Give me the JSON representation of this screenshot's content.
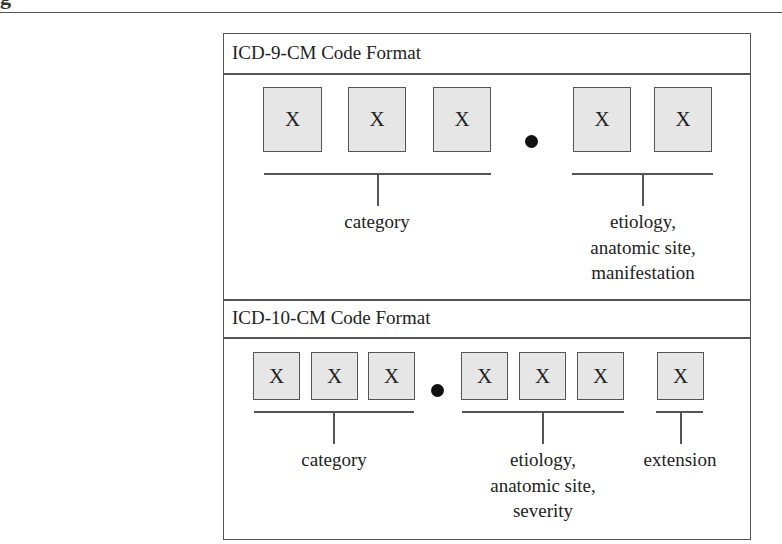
{
  "page": {
    "cropped_heading_fragment": "g"
  },
  "diagram": {
    "icd9": {
      "title": "ICD-9-CM Code Format",
      "boxes": [
        "X",
        "X",
        "X",
        "X",
        "X"
      ],
      "separator": "•",
      "groups": [
        {
          "label_lines": [
            "category"
          ]
        },
        {
          "label_lines": [
            "etiology,",
            "anatomic site,",
            "manifestation"
          ]
        }
      ]
    },
    "icd10": {
      "title": "ICD-10-CM Code Format",
      "boxes": [
        "X",
        "X",
        "X",
        "X",
        "X",
        "X",
        "X"
      ],
      "separator": "•",
      "groups": [
        {
          "label_lines": [
            "category"
          ]
        },
        {
          "label_lines": [
            "etiology,",
            "anatomic site,",
            "severity"
          ]
        },
        {
          "label_lines": [
            "extension"
          ]
        }
      ]
    }
  }
}
